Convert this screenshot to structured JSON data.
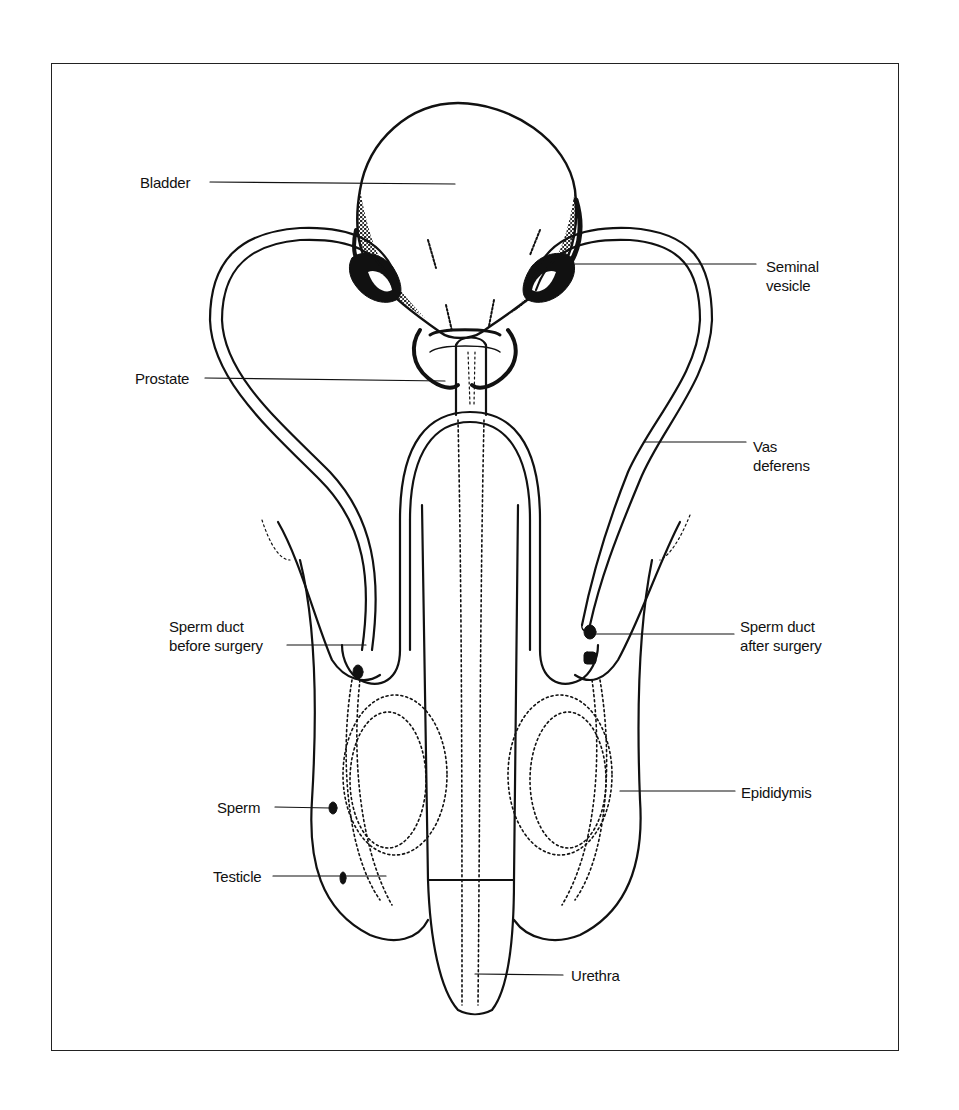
{
  "diagram": {
    "title": "",
    "labels": {
      "bladder": {
        "lines": [
          "Bladder"
        ]
      },
      "seminal_vesicle": {
        "lines": [
          "Seminal",
          "vesicle"
        ]
      },
      "prostate": {
        "lines": [
          "Prostate"
        ]
      },
      "vas_deferens": {
        "lines": [
          "Vas",
          "deferens"
        ]
      },
      "sperm_duct_before": {
        "lines": [
          "Sperm duct",
          "before surgery"
        ]
      },
      "sperm_duct_after": {
        "lines": [
          "Sperm duct",
          "after surgery"
        ]
      },
      "sperm": {
        "lines": [
          "Sperm"
        ]
      },
      "testicle": {
        "lines": [
          "Testicle"
        ]
      },
      "epididymis": {
        "lines": [
          "Epididymis"
        ]
      },
      "urethra": {
        "lines": [
          "Urethra"
        ]
      }
    },
    "colors": {
      "ink": "#111111",
      "background": "#ffffff",
      "frame": "#222222"
    }
  }
}
